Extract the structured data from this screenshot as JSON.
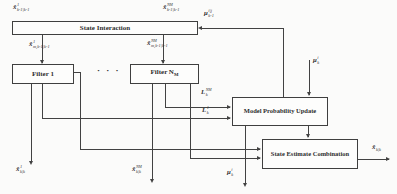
{
  "diagram": {
    "colors": {
      "background": "#fbfbfa",
      "line": "#424242",
      "box_fill": "#fdfdfc",
      "text": "#2e2e2e"
    },
    "ellipsis": {
      "text": "· · ·"
    },
    "boxes": [
      {
        "id": "state-interaction",
        "label": "State Interaction"
      },
      {
        "id": "filter-1",
        "label": "Filter 1"
      },
      {
        "id": "filter-nm",
        "label": "Filter N",
        "label_sub": "M"
      },
      {
        "id": "model-probability-update",
        "label": "Model Probability Update"
      },
      {
        "id": "state-estimate-combination",
        "label": "State Estimate Combination"
      }
    ],
    "labels": [
      {
        "id": "label-prev-state-1",
        "x": 13,
        "y": 3,
        "base": "x̂",
        "sup": "1",
        "sub": "k-1|k-1"
      },
      {
        "id": "label-prev-state-nm",
        "x": 163,
        "y": 3,
        "base": "x̂",
        "sup": "N",
        "supsub": "M",
        "sub": "k-1|k-1"
      },
      {
        "id": "label-mixing-prob",
        "x": 204,
        "y": 9,
        "base": "μ",
        "sup": "i|j",
        "sub": "k-1"
      },
      {
        "id": "label-mixed-state-1",
        "x": 29,
        "y": 40,
        "base": "x̂",
        "sup": "1",
        "sub": "m,k-1|k-1"
      },
      {
        "id": "label-mixed-state-nm",
        "x": 147,
        "y": 39,
        "base": "x̂",
        "sup": "N",
        "supsub": "M",
        "sub": "m,k-1|k-1"
      },
      {
        "id": "label-model-prob-top",
        "x": 313,
        "y": 56,
        "base": "μ",
        "sup": "i",
        "sub": "k"
      },
      {
        "id": "label-likelihood-nm",
        "x": 201,
        "y": 88,
        "base": "L",
        "sup": "N",
        "supsub": "M",
        "sub": "k"
      },
      {
        "id": "label-likelihood-1",
        "x": 202,
        "y": 106,
        "base": "L",
        "sup": "1",
        "sub": "k"
      },
      {
        "id": "label-out-state-1",
        "x": 16,
        "y": 165,
        "base": "x̂",
        "sup": "1",
        "sub": "k|k"
      },
      {
        "id": "label-out-state-nm",
        "x": 132,
        "y": 165,
        "base": "x̂",
        "sup": "N",
        "supsub": "M",
        "sub": "k|k"
      },
      {
        "id": "label-model-prob-out",
        "x": 227,
        "y": 168,
        "base": "μ",
        "sup": "i",
        "sub": "k"
      },
      {
        "id": "label-combined-state",
        "x": 372,
        "y": 143,
        "base": "x̂",
        "sup": "",
        "sub": "k|k"
      }
    ]
  }
}
